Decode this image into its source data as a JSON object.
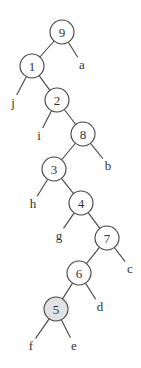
{
  "diagram": {
    "type": "binary-tree",
    "highlight_color": "#e2e2e2",
    "nodes": [
      {
        "id": "9",
        "label": "9",
        "x": 62,
        "y": 32,
        "highlight": false
      },
      {
        "id": "1",
        "label": "1",
        "x": 32,
        "y": 66,
        "highlight": false
      },
      {
        "id": "2",
        "label": "2",
        "x": 57,
        "y": 100,
        "highlight": false
      },
      {
        "id": "8",
        "label": "8",
        "x": 83,
        "y": 134,
        "highlight": false
      },
      {
        "id": "3",
        "label": "3",
        "x": 54,
        "y": 169,
        "highlight": false
      },
      {
        "id": "4",
        "label": "4",
        "x": 81,
        "y": 203,
        "highlight": false
      },
      {
        "id": "7",
        "label": "7",
        "x": 107,
        "y": 238,
        "highlight": false
      },
      {
        "id": "6",
        "label": "6",
        "x": 79,
        "y": 273,
        "highlight": false
      },
      {
        "id": "5",
        "label": "5",
        "x": 56,
        "y": 309,
        "highlight": true
      }
    ],
    "leaves": [
      {
        "id": "a",
        "label": "a",
        "x": 82,
        "y": 64
      },
      {
        "id": "j",
        "label": "j",
        "x": 13,
        "y": 102
      },
      {
        "id": "i",
        "label": "i",
        "x": 39,
        "y": 135
      },
      {
        "id": "b",
        "label": "b",
        "x": 108,
        "y": 165
      },
      {
        "id": "h",
        "label": "h",
        "x": 33,
        "y": 203
      },
      {
        "id": "g",
        "label": "g",
        "x": 59,
        "y": 235
      },
      {
        "id": "c",
        "label": "c",
        "x": 130,
        "y": 268
      },
      {
        "id": "d",
        "label": "d",
        "x": 100,
        "y": 306
      },
      {
        "id": "f",
        "label": "f",
        "x": 31,
        "y": 345
      },
      {
        "id": "e",
        "label": "e",
        "x": 74,
        "y": 345
      }
    ],
    "edges": [
      [
        "9",
        "1"
      ],
      [
        "9",
        "a"
      ],
      [
        "1",
        "j"
      ],
      [
        "1",
        "2"
      ],
      [
        "2",
        "i"
      ],
      [
        "2",
        "8"
      ],
      [
        "8",
        "3"
      ],
      [
        "8",
        "b"
      ],
      [
        "3",
        "h"
      ],
      [
        "3",
        "4"
      ],
      [
        "4",
        "g"
      ],
      [
        "4",
        "7"
      ],
      [
        "7",
        "6"
      ],
      [
        "7",
        "c"
      ],
      [
        "6",
        "5"
      ],
      [
        "6",
        "d"
      ],
      [
        "5",
        "f"
      ],
      [
        "5",
        "e"
      ]
    ]
  }
}
